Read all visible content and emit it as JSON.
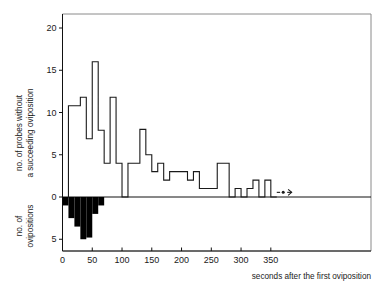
{
  "chart_data": {
    "type": "bar",
    "title": "",
    "subtitle": "",
    "xlabel": "seconds after the first oviposition",
    "ylabel_top": "no. of probes without a succeeding oviposition",
    "ylabel_bottom": "no. of ovipositions",
    "xlim": [
      0,
      390
    ],
    "ylim_top": [
      0,
      22
    ],
    "ylim_bottom": [
      0,
      7
    ],
    "grid": false,
    "legend": null,
    "xticks": [
      0,
      50,
      100,
      150,
      200,
      250,
      300,
      350
    ],
    "xtick_labels": [
      "0",
      "50",
      "100",
      "150",
      "200",
      "250",
      "300",
      "350"
    ],
    "yticks_top": [
      0,
      5,
      10,
      15,
      20
    ],
    "ytick_labels_top": [
      "0",
      "5",
      "10",
      "15",
      "20"
    ],
    "yticks_bottom": [
      0,
      5
    ],
    "ytick_labels_bottom": [
      "0",
      "5"
    ],
    "bin_width": 10,
    "annotations": [
      {
        "name": "continues-arrow",
        "text": "",
        "x_start": 360,
        "x_end": 385,
        "y": 0.55,
        "symbol": "dash-dot-arrow"
      }
    ],
    "series": [
      {
        "name": "no. of probes without a succeeding oviposition",
        "direction": "up",
        "style": "step-outline",
        "bin_starts": [
          10,
          20,
          30,
          40,
          50,
          60,
          70,
          80,
          90,
          100,
          110,
          120,
          130,
          140,
          150,
          160,
          170,
          180,
          190,
          200,
          210,
          220,
          230,
          240,
          250,
          260,
          270,
          280,
          290,
          300,
          310,
          320,
          330,
          340,
          350
        ],
        "values": [
          10.8,
          10.8,
          11.8,
          6.9,
          16,
          7.9,
          4,
          11.8,
          4,
          0,
          4,
          4,
          8,
          5,
          3,
          4,
          2,
          3,
          3,
          3,
          2,
          3,
          1,
          1,
          1,
          4,
          4,
          0,
          1,
          0,
          1,
          2,
          0,
          2,
          0
        ]
      },
      {
        "name": "no. of ovipositions",
        "direction": "down",
        "style": "filled-bars",
        "bin_starts": [
          0,
          10,
          20,
          30,
          40,
          50,
          60
        ],
        "values": [
          1,
          2.5,
          3.5,
          5,
          4.8,
          2,
          1
        ]
      }
    ]
  },
  "chart_meta": {
    "frame_color": "#8a8a8a",
    "axis_color": "#111111",
    "line_color": "#1a1a1a",
    "fill_color": "#000000",
    "background": "#ffffff"
  }
}
